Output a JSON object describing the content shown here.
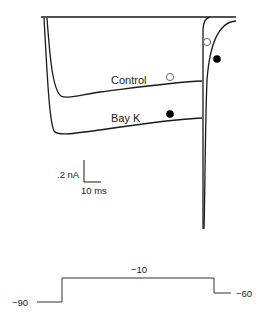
{
  "figure": {
    "traces": {
      "control_label": "Control",
      "bayk_label": "Bay K"
    },
    "markers": {
      "control_marker": "open-circle",
      "bayk_marker": "filled-circle"
    },
    "scale_bar": {
      "current_label": ".2 nA",
      "time_label": "10 ms"
    },
    "protocol": {
      "holding_label": "−90",
      "step_label": "−10",
      "return_label": "−60"
    }
  },
  "colors": {
    "line": "#1a1a1a",
    "background": "#ffffff"
  }
}
